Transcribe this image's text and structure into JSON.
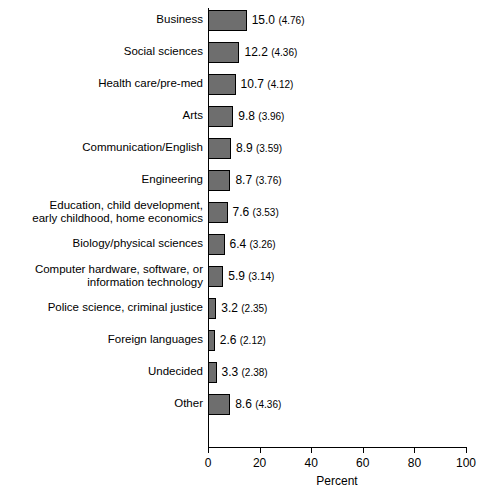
{
  "chart_data": {
    "type": "bar",
    "orientation": "horizontal",
    "title": "",
    "xlabel": "Percent",
    "ylabel": "",
    "xlim": [
      0,
      100
    ],
    "xticks": [
      0,
      20,
      40,
      60,
      80,
      100
    ],
    "xtick_labels": [
      "0",
      "20",
      "40",
      "60",
      "80",
      "100"
    ],
    "grid": false,
    "legend": null,
    "bar_color": "#6e6e6e",
    "bar_edge_color": "#000000",
    "categories": [
      "Business",
      "Social sciences",
      "Health care/pre-med",
      "Arts",
      "Communication/English",
      "Engineering",
      "Education, child development,\nearly childhood, home economics",
      "Biology/physical sciences",
      "Computer hardware, software, or\ninformation technology",
      "Police science, criminal justice",
      "Foreign languages",
      "Undecided",
      "Other"
    ],
    "values": [
      15.0,
      12.2,
      10.7,
      9.8,
      8.9,
      8.7,
      7.6,
      6.4,
      5.9,
      3.2,
      2.6,
      3.3,
      8.6
    ],
    "errors": [
      4.76,
      4.36,
      4.12,
      3.96,
      3.59,
      3.76,
      3.53,
      3.26,
      3.14,
      2.35,
      2.12,
      2.38,
      4.36
    ],
    "data_labels": [
      "15.0",
      "12.2",
      "10.7",
      "9.8",
      "8.9",
      "8.7",
      "7.6",
      "6.4",
      "5.9",
      "3.2",
      "2.6",
      "3.3",
      "8.6"
    ],
    "error_labels": [
      "(4.76)",
      "(4.36)",
      "(4.12)",
      "(3.96)",
      "(3.59)",
      "(3.76)",
      "(3.53)",
      "(3.26)",
      "(3.14)",
      "(2.35)",
      "(2.12)",
      "(2.38)",
      "(4.36)"
    ]
  }
}
